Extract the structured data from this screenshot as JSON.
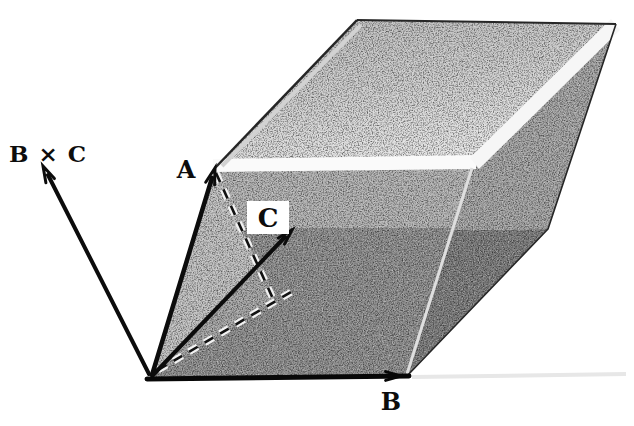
{
  "diagram": {
    "labels": {
      "cross_product": "B × C",
      "vector_a": "A",
      "vector_b": "B",
      "vector_c": "C"
    },
    "colors": {
      "ink": "#0d0d0d",
      "paper": "#ffffff",
      "face_top": "#c9c9c9",
      "face_front_upper": "#b2b2b2",
      "face_front_lower": "#8f8f8f",
      "face_right_upper": "#a4a4a4",
      "face_right_lower": "#7d7d7d",
      "edge_highlight": "#fafafa"
    }
  }
}
